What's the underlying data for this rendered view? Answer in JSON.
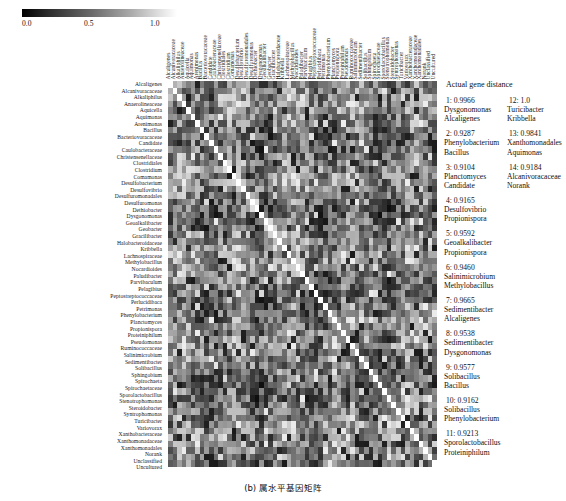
{
  "colorbar": {
    "name": "grayscale-colorbar",
    "ticks": [
      "0.0",
      "0.5",
      "1.0"
    ],
    "min_color": "#000000",
    "max_color": "#ffffff"
  },
  "caption": "(b) 属水平基因矩阵",
  "axis_labels": [
    "Alcaligenes",
    "Alcanivoracaceae",
    "Alkaliphilus",
    "Anaerolineaceae",
    "Aquicella",
    "Aquimonas",
    "Arenimonas",
    "Bacillus",
    "Bacteriovoracaceae",
    "Candidate",
    "Caulobacteraceae",
    "Christensenellaceae",
    "Clostridiales",
    "Clostridium",
    "Comamonas",
    "Desulfobacterium",
    "Desulfovibrio",
    "Desulfuromonadales",
    "Desulfuromonas",
    "Dethiobacter",
    "Dysgonomonas",
    "Geoalkalibacter",
    "Geobacter",
    "Gracilibacter",
    "Halobacteroidaceae",
    "Kribbella",
    "Lachnospiraceae",
    "Methylobacillus",
    "Nocardioides",
    "Paludibacter",
    "Parvibaculum",
    "Pelagibius",
    "Peptostreptococcaceae",
    "Perlucidibaca",
    "Petrimonas",
    "Phenylobacterium",
    "Planctomyces",
    "Propionispora",
    "Proteiniphilum",
    "Pseudomonas",
    "Ruminococcaceae",
    "Salinimicrobium",
    "Sedimentibacter",
    "Solibacillus",
    "Sphingobium",
    "Spirochaeta",
    "Spirochaetaceae",
    "Sporolactobacillus",
    "Stenotrophomonas",
    "Steroidobacter",
    "Syntrophomonas",
    "Turicibacter",
    "Variovorax",
    "Xanthobacteraceae",
    "Xanthomonadaceae",
    "Xanthomonadales",
    "Norank",
    "Unclassified",
    "Uncultured"
  ],
  "legend": {
    "title": "Actual gene distance",
    "column_1": [
      {
        "id": "1: 0.9966",
        "taxon_a": "Dysgonomonas",
        "taxon_b": "Alcaligenes"
      },
      {
        "id": "2: 0.9287",
        "taxon_a": "Phenylobacterium",
        "taxon_b": "Bacillus"
      },
      {
        "id": "3: 0.9104",
        "taxon_a": "Planctomyces",
        "taxon_b": "Candidate"
      },
      {
        "id": "4: 0.9165",
        "taxon_a": "Desulfovibrio",
        "taxon_b": "Propionispora"
      },
      {
        "id": "5: 0.9592",
        "taxon_a": "Geoalkalibacter",
        "taxon_b": "Propionispora"
      },
      {
        "id": "6: 0.9460",
        "taxon_a": "Salinimicrobium",
        "taxon_b": "Methylobacillus"
      },
      {
        "id": "7: 0.9665",
        "taxon_a": "Sedimentibacter",
        "taxon_b": "Alcaligenes"
      },
      {
        "id": "8: 0.9538",
        "taxon_a": "Sedimentibacter",
        "taxon_b": "Dysgonomonas"
      },
      {
        "id": "9: 0.9577",
        "taxon_a": "Solibacillus",
        "taxon_b": "Bacillus"
      },
      {
        "id": "10: 0.9162",
        "taxon_a": "Solibacillus",
        "taxon_b": "Phenylobacterium"
      },
      {
        "id": "11: 0.9213",
        "taxon_a": "Sporolactobacillus",
        "taxon_b": "Proteiniphilum"
      }
    ],
    "column_2": [
      {
        "id": "12: 1.0",
        "taxon_a": "Turicibacter",
        "taxon_b": "Kribbella"
      },
      {
        "id": "13: 0.9841",
        "taxon_a": "Xanthomonadales",
        "taxon_b": "Aquimonas"
      },
      {
        "id": "14: 0.9184",
        "taxon_a": "Alcanivoracaceae",
        "taxon_b": "Norank"
      }
    ]
  },
  "chart_data": {
    "type": "heatmap",
    "title": "",
    "xlabel": "",
    "ylabel": "",
    "colormap": "gray",
    "vmin": 0.0,
    "vmax": 1.0,
    "colorbar_ticks": [
      0.0,
      0.5,
      1.0
    ],
    "grid": false,
    "legend_position": "right",
    "n_rows": 59,
    "n_cols": 59,
    "diagonal_value": 1.0,
    "note": "Symmetric genus-level gene distance matrix; bright white diagonal = self-similarity 1.0; off-diagonal cells range roughly 0.30-0.85 in grayscale."
  }
}
